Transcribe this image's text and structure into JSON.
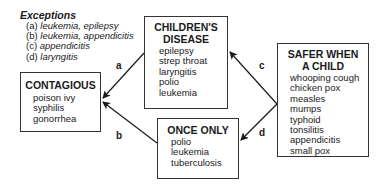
{
  "exceptions": {
    "title": "Exceptions",
    "items": [
      {
        "letter": "(a)",
        "text": "leukemia, epilepsy"
      },
      {
        "letter": "(b)",
        "text": "leukemia, appendicitis"
      },
      {
        "letter": "(c)",
        "text": "appendicitis"
      },
      {
        "letter": "(d)",
        "text": "laryngitis"
      }
    ]
  },
  "nodes": {
    "contagious": {
      "title": "CONTAGIOUS",
      "items": [
        "poison ivy",
        "syphilis",
        "gonorrhea"
      ]
    },
    "childrens_disease": {
      "title_line1": "CHILDREN'S",
      "title_line2": "DISEASE",
      "items": [
        "epilepsy",
        "strep throat",
        "laryngitis",
        "polio",
        "leukemia"
      ]
    },
    "once_only": {
      "title": "ONCE ONLY",
      "items": [
        "polio",
        "leukemia",
        "tuberculosis"
      ]
    },
    "safer_when_child": {
      "title_line1": "SAFER WHEN",
      "title_line2": "A CHILD",
      "items": [
        "whooping cough",
        "chicken pox",
        "measles",
        "mumps",
        "typhoid",
        "tonsilitis",
        "appendicitis",
        "small pox"
      ]
    }
  },
  "edges": [
    {
      "label": "a",
      "from": "childrens_disease",
      "to": "contagious"
    },
    {
      "label": "b",
      "from": "once_only",
      "to": "contagious"
    },
    {
      "label": "c",
      "from": "safer_when_child",
      "to": "childrens_disease"
    },
    {
      "label": "d",
      "from": "safer_when_child",
      "to": "once_only"
    }
  ]
}
